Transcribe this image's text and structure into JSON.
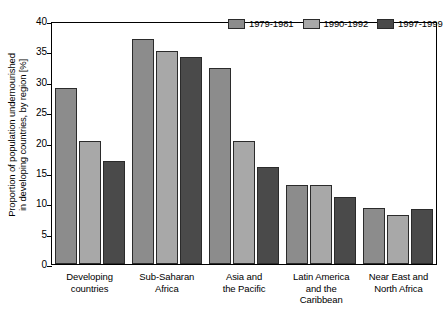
{
  "chart_data": {
    "type": "bar",
    "title": "",
    "xlabel": "",
    "ylabel": "Proportion of population undernourished in developing countries, by region [%]",
    "ylabel_lines": [
      "Proportion of population undernourished",
      "in developing countries, by region [%]"
    ],
    "ylim": [
      0,
      40
    ],
    "ytick_step": 5,
    "yticks": [
      40,
      35,
      30,
      25,
      20,
      15,
      10,
      5,
      0
    ],
    "grid": false,
    "legend_position": "top-right",
    "categories": [
      "Developing countries",
      "Sub-Saharan Africa",
      "Asia and the Pacific",
      "Latin America and the Caribbean",
      "Near East and North Africa"
    ],
    "category_lines": [
      [
        "Developing",
        "countries"
      ],
      [
        "Sub-Saharan",
        "Africa"
      ],
      [
        "Asia and",
        "the Pacific"
      ],
      [
        "Latin America",
        "and the",
        "Caribbean"
      ],
      [
        "Near East and",
        "North Africa"
      ]
    ],
    "series": [
      {
        "name": "1979-1981",
        "color": "#8c8c8c",
        "values": [
          29.0,
          37.0,
          32.2,
          13.0,
          9.3
        ]
      },
      {
        "name": "1990-1992",
        "color": "#a8a8a8",
        "values": [
          20.2,
          35.0,
          20.3,
          13.0,
          8.0
        ]
      },
      {
        "name": "1997-1999",
        "color": "#4a4a4a",
        "values": [
          17.0,
          34.0,
          16.0,
          11.0,
          9.0
        ]
      }
    ]
  },
  "colors": {
    "axis": "#000000",
    "bar_outline": "#2b2b2b",
    "background": "#ffffff",
    "series_1": "#8c8c8c",
    "series_2": "#a8a8a8",
    "series_3": "#4a4a4a"
  }
}
